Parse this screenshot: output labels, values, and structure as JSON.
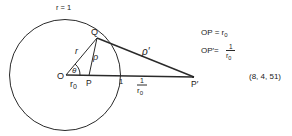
{
  "diagram": {
    "circle_label": "r = 1",
    "points": {
      "O": "O",
      "P": "P",
      "Q": "Q",
      "P_prime": "P′"
    },
    "segment_labels": {
      "OQ": "r",
      "PQ": "ρ",
      "P_prime_Q": "ρ′",
      "OP": "r",
      "OP_sub": "0",
      "angle": "θ",
      "unit_mark": "1",
      "inv_num": "1",
      "inv_den": "r",
      "inv_den_sub": "0"
    },
    "equations": {
      "eq1_lhs": "OP = r",
      "eq1_sub": "0",
      "eq2_lhs": "OP′=",
      "eq2_num": "1",
      "eq2_den": "r",
      "eq2_den_sub": "0"
    },
    "equation_number": "(8, 4, 51)"
  }
}
